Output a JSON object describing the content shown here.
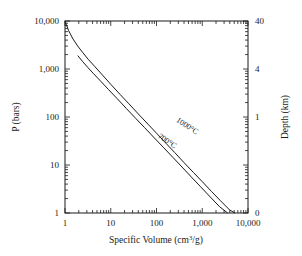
{
  "chart_data": {
    "type": "line",
    "title": "",
    "xlabel": "Specific Volume (cm3/g)",
    "xlabel_main": "Specific Volume (cm",
    "xlabel_sup": "3",
    "xlabel_tail": "/g)",
    "ylabel": "P (bars)",
    "y2label": "Depth (km)",
    "xscale": "log",
    "yscale": "log",
    "xlim": [
      1,
      10000
    ],
    "ylim": [
      1,
      10000
    ],
    "grid": false,
    "legend_position": "inline-curve-labels",
    "xticks": [
      1,
      10,
      100,
      1000,
      10000
    ],
    "xticklabels": [
      "1",
      "10",
      "100",
      "1,000",
      "10,000"
    ],
    "yticks": [
      1,
      10,
      100,
      1000,
      10000
    ],
    "yticklabels": [
      "1",
      "10",
      "100",
      "1,000",
      "10,000"
    ],
    "y2ticks": [
      0,
      1,
      4,
      40
    ],
    "y2ticklabels": [
      "0",
      "1",
      "4",
      "40"
    ],
    "y2tick_positions_frac": [
      0.0,
      0.5,
      0.75,
      1.0
    ],
    "minor_ticks": true,
    "series": [
      {
        "name": "1000°C",
        "label": "1000°C",
        "color": "#1a1a1a",
        "points": [
          [
            1.0,
            10000
          ],
          [
            1.2,
            6300
          ],
          [
            1.5,
            4200
          ],
          [
            1.9,
            3000
          ],
          [
            2.4,
            2250
          ],
          [
            3.2,
            1600
          ],
          [
            4.5,
            1120
          ],
          [
            6.5,
            760
          ],
          [
            10,
            480
          ],
          [
            16,
            295
          ],
          [
            25,
            188
          ],
          [
            40,
            116
          ],
          [
            65,
            71
          ],
          [
            100,
            46
          ],
          [
            160,
            28.5
          ],
          [
            250,
            18.2
          ],
          [
            400,
            11.2
          ],
          [
            650,
            6.9
          ],
          [
            1000,
            4.5
          ],
          [
            1600,
            2.8
          ],
          [
            2500,
            1.8
          ],
          [
            4000,
            1.15
          ],
          [
            5200,
            1.0
          ]
        ]
      },
      {
        "name": "700°C",
        "label": "700°C",
        "color": "#1a1a1a",
        "points": [
          [
            1.9,
            1900
          ],
          [
            2.4,
            1450
          ],
          [
            3.2,
            1060
          ],
          [
            4.2,
            800
          ],
          [
            6.0,
            560
          ],
          [
            9.0,
            370
          ],
          [
            14,
            238
          ],
          [
            22,
            150
          ],
          [
            35,
            94
          ],
          [
            55,
            60
          ],
          [
            90,
            36.5
          ],
          [
            140,
            23.5
          ],
          [
            230,
            14.3
          ],
          [
            360,
            9.1
          ],
          [
            580,
            5.6
          ],
          [
            900,
            3.6
          ],
          [
            1500,
            2.15
          ],
          [
            2400,
            1.35
          ],
          [
            3600,
            1.0
          ]
        ]
      }
    ],
    "annotations": [
      {
        "text": "1000°C",
        "x_px": 186,
        "y_px": 128,
        "rotation": 33
      },
      {
        "text": "700°C",
        "x_px": 166,
        "y_px": 143,
        "rotation": 33
      }
    ]
  }
}
